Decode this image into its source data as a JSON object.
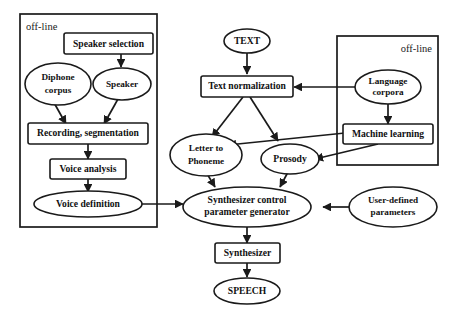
{
  "diagram": {
    "colors": {
      "stroke": "#1a1a1a",
      "fill": "#ffffff",
      "text": "#111111"
    },
    "groups": [
      {
        "id": "offline_left",
        "label": "off-line",
        "label_align": "left"
      },
      {
        "id": "offline_right",
        "label": "off-line",
        "label_align": "right"
      }
    ],
    "nodes": [
      {
        "id": "speaker_selection",
        "shape": "box",
        "label": "Speaker selection"
      },
      {
        "id": "diphone_corpus",
        "shape": "ellipse",
        "label_line1": "Diphone",
        "label_line2": "corpus"
      },
      {
        "id": "speaker",
        "shape": "ellipse",
        "label": "Speaker"
      },
      {
        "id": "recording_seg",
        "shape": "box",
        "label": "Recording, segmentation"
      },
      {
        "id": "voice_analysis",
        "shape": "box",
        "label": "Voice analysis"
      },
      {
        "id": "voice_definition",
        "shape": "ellipse",
        "label": "Voice definition"
      },
      {
        "id": "text",
        "shape": "ellipse",
        "label": "TEXT"
      },
      {
        "id": "text_normalization",
        "shape": "box",
        "label": "Text normalization"
      },
      {
        "id": "language_corpora",
        "shape": "ellipse",
        "label_line1": "Language",
        "label_line2": "corpora"
      },
      {
        "id": "machine_learning",
        "shape": "box",
        "label": "Machine learning"
      },
      {
        "id": "letter_to_phoneme",
        "shape": "ellipse",
        "label_line1": "Letter to",
        "label_line2": "Phoneme"
      },
      {
        "id": "prosody",
        "shape": "ellipse",
        "label": "Prosody"
      },
      {
        "id": "synth_control",
        "shape": "ellipse",
        "label_line1": "Synthesizer control",
        "label_line2": "parameter generator"
      },
      {
        "id": "user_params",
        "shape": "ellipse",
        "label_line1": "User-defined",
        "label_line2": "parameters"
      },
      {
        "id": "synthesizer",
        "shape": "box",
        "label": "Synthesizer"
      },
      {
        "id": "speech",
        "shape": "ellipse",
        "label": "SPEECH"
      }
    ],
    "edges": [
      {
        "from": "speaker_selection",
        "to": "speaker"
      },
      {
        "from": "diphone_corpus",
        "to": "recording_seg"
      },
      {
        "from": "speaker",
        "to": "recording_seg"
      },
      {
        "from": "recording_seg",
        "to": "voice_analysis"
      },
      {
        "from": "voice_analysis",
        "to": "voice_definition"
      },
      {
        "from": "voice_definition",
        "to": "synth_control"
      },
      {
        "from": "text",
        "to": "text_normalization"
      },
      {
        "from": "language_corpora",
        "to": "text_normalization"
      },
      {
        "from": "language_corpora",
        "to": "machine_learning"
      },
      {
        "from": "machine_learning",
        "to": "letter_to_phoneme"
      },
      {
        "from": "machine_learning",
        "to": "prosody"
      },
      {
        "from": "text_normalization",
        "to": "letter_to_phoneme"
      },
      {
        "from": "text_normalization",
        "to": "prosody"
      },
      {
        "from": "letter_to_phoneme",
        "to": "synth_control"
      },
      {
        "from": "prosody",
        "to": "synth_control"
      },
      {
        "from": "user_params",
        "to": "synth_control"
      },
      {
        "from": "synth_control",
        "to": "synthesizer"
      },
      {
        "from": "synthesizer",
        "to": "speech"
      }
    ]
  }
}
